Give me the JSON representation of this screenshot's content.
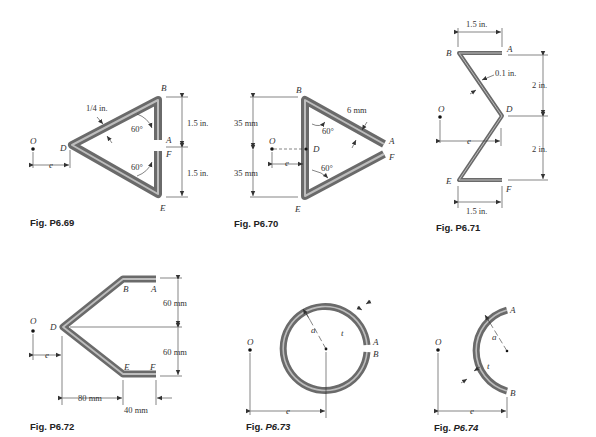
{
  "figures": [
    {
      "id": "P6.69",
      "caption": "Fig. P6.69",
      "points": {
        "O": "O",
        "D": "D",
        "B": "B",
        "A": "A",
        "F": "F",
        "E": "E"
      },
      "dims": {
        "thickness": "1/4 in.",
        "upper": "1.5 in.",
        "lower": "1.5 in.",
        "angle_top": "60°",
        "angle_bottom": "60°",
        "offset": "e"
      }
    },
    {
      "id": "P6.70",
      "caption": "Fig. P6.70",
      "points": {
        "O": "O",
        "D": "D",
        "B": "B",
        "A": "A",
        "F": "F",
        "E": "E"
      },
      "dims": {
        "thickness": "6 mm",
        "upper": "35 mm",
        "lower": "35 mm",
        "angle_top": "60°",
        "angle_bottom": "60°",
        "offset": "e"
      }
    },
    {
      "id": "P6.71",
      "caption": "Fig. P6.71",
      "points": {
        "O": "O",
        "D": "D",
        "B": "B",
        "A": "A",
        "F": "F",
        "E": "E"
      },
      "dims": {
        "top_width": "1.5 in.",
        "bottom_width": "1.5 in.",
        "thickness": "0.1 in.",
        "upper": "2 in.",
        "lower": "2 in.",
        "offset": "e"
      }
    },
    {
      "id": "P6.72",
      "caption": "Fig. P6.72",
      "points": {
        "O": "O",
        "D": "D",
        "B": "B",
        "A": "A",
        "F": "F",
        "E": "E"
      },
      "dims": {
        "upper": "60 mm",
        "lower": "60 mm",
        "horizontal": "80 mm",
        "flange": "40 mm",
        "offset": "e"
      }
    },
    {
      "id": "P6.73",
      "caption_prefix": "Fig. ",
      "caption_num": "P6.73",
      "points": {
        "O": "O",
        "A": "A",
        "B": "B"
      },
      "dims": {
        "radius": "a",
        "thickness": "t",
        "offset": "e"
      }
    },
    {
      "id": "P6.74",
      "caption_prefix": "Fig. ",
      "caption_num": "P6.74",
      "points": {
        "O": "O",
        "A": "A",
        "B": "B"
      },
      "dims": {
        "radius": "a",
        "thickness": "t",
        "offset": "e"
      }
    }
  ]
}
